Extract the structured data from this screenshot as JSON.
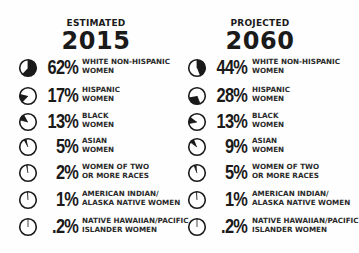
{
  "left": {
    "subtitle": "ESTIMATED",
    "year": "2015",
    "rows": [
      {
        "pct": "62%",
        "label": "WHITE NON-HISPANIC\nWOMEN",
        "start": 0,
        "value": 62
      },
      {
        "pct": "17%",
        "label": "HISPANIC\nWOMEN",
        "start": 62,
        "value": 17
      },
      {
        "pct": "13%",
        "label": "BLACK\nWOMEN",
        "start": 79,
        "value": 13
      },
      {
        "pct": "5%",
        "label": "ASIAN\nWOMEN",
        "start": 92,
        "value": 5
      },
      {
        "pct": "2%",
        "label": "WOMEN OF TWO\nOR MORE RACES",
        "start": 97,
        "value": 2
      },
      {
        "pct": "1%",
        "label": "AMERICAN INDIAN/\nALASKA NATIVE WOMEN",
        "start": 99,
        "value": 1
      },
      {
        "pct": ".2%",
        "label": "NATIVE HAWAIIAN/PACIFIC\nISLANDER WOMEN",
        "start": 100,
        "value": 0.2
      }
    ]
  },
  "right": {
    "subtitle": "PROJECTED",
    "year": "2060",
    "rows": [
      {
        "pct": "44%",
        "label": "WHITE NON-HISPANIC\nWOMEN",
        "start": 0,
        "value": 44
      },
      {
        "pct": "28%",
        "label": "HISPANIC\nWOMEN",
        "start": 44,
        "value": 28
      },
      {
        "pct": "13%",
        "label": "BLACK\nWOMEN",
        "start": 72,
        "value": 13
      },
      {
        "pct": "9%",
        "label": "ASIAN\nWOMEN",
        "start": 85,
        "value": 9
      },
      {
        "pct": "5%",
        "label": "WOMEN OF TWO\nOR MORE RACES",
        "start": 94,
        "value": 5
      },
      {
        "pct": "1%",
        "label": "AMERICAN INDIAN/\nALASKA NATIVE WOMEN",
        "start": 99,
        "value": 1
      },
      {
        "pct": ".2%",
        "label": "NATIVE HAWAIIAN/PACIFIC\nISLANDER WOMEN",
        "start": 100,
        "value": 0.2
      }
    ]
  },
  "colors": {
    "ink": "#1a1a1a",
    "background": "#fefefe"
  },
  "chart_data": [
    {
      "type": "pie",
      "title": "ESTIMATED 2015",
      "categories": [
        "White non-Hispanic women",
        "Hispanic women",
        "Black women",
        "Asian women",
        "Women of two or more races",
        "American Indian/Alaska Native women",
        "Native Hawaiian/Pacific Islander women"
      ],
      "values": [
        62,
        17,
        13,
        5,
        2,
        1,
        0.2
      ],
      "unit": "%"
    },
    {
      "type": "pie",
      "title": "PROJECTED 2060",
      "categories": [
        "White non-Hispanic women",
        "Hispanic women",
        "Black women",
        "Asian women",
        "Women of two or more races",
        "American Indian/Alaska Native women",
        "Native Hawaiian/Pacific Islander women"
      ],
      "values": [
        44,
        28,
        13,
        9,
        5,
        1,
        0.2
      ],
      "unit": "%"
    }
  ]
}
